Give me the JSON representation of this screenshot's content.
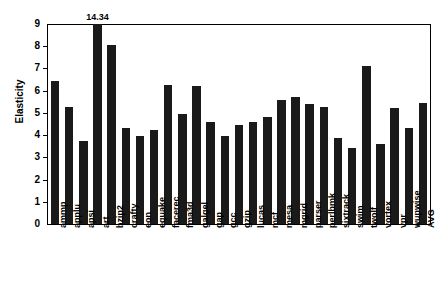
{
  "chart_data": {
    "type": "bar",
    "title": "",
    "xlabel": "",
    "ylabel": "Elasticity",
    "ylim": [
      0,
      9
    ],
    "ytick_labels": [
      "0",
      "1",
      "2",
      "3",
      "4",
      "5",
      "6",
      "7",
      "8",
      "9"
    ],
    "ytick_values": [
      0,
      1,
      2,
      3,
      4,
      5,
      6,
      7,
      8,
      9
    ],
    "grid": false,
    "legend": false,
    "bar_color": "#1a1a1a",
    "axis_color": "#000000",
    "background_color": "#ffffff",
    "clipped_note": "The 'art' bar exceeds the axis maximum and is labeled with its value 14.34",
    "annotations": [
      {
        "label": "14.34",
        "category": "art",
        "value": 14.34
      }
    ],
    "categories": [
      "ammp",
      "applu",
      "apsi",
      "art",
      "bzip2",
      "crafty",
      "eon",
      "equake",
      "facerec",
      "fma3d",
      "galgel",
      "gap",
      "gcc",
      "gzip",
      "lucas",
      "mcf",
      "mesa",
      "mgrid",
      "parser",
      "perlbmk",
      "sixtrack",
      "swim",
      "twolf",
      "vortex",
      "vpr",
      "wupwise",
      "AVG"
    ],
    "values": [
      6.45,
      5.25,
      3.75,
      14.34,
      8.05,
      4.3,
      3.95,
      4.25,
      6.25,
      4.95,
      6.2,
      4.6,
      3.95,
      4.45,
      4.6,
      4.8,
      5.6,
      5.7,
      5.4,
      5.25,
      3.85,
      3.4,
      7.1,
      3.6,
      5.2,
      4.3,
      5.45
    ],
    "avg_value": 5.35
  }
}
